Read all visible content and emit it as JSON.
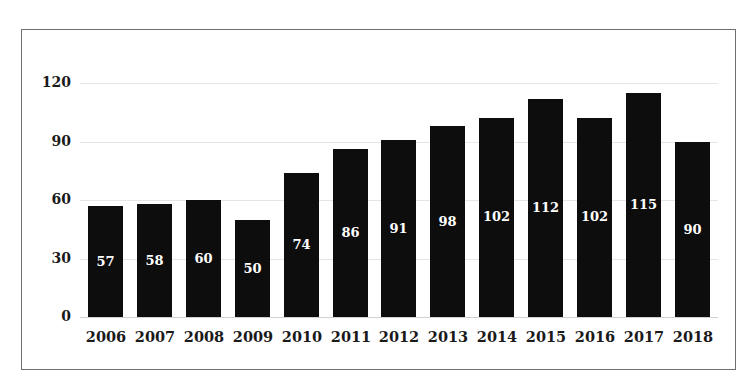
{
  "chart_data": {
    "type": "bar",
    "title": "",
    "xlabel": "",
    "ylabel": "",
    "categories": [
      "2006",
      "2007",
      "2008",
      "2009",
      "2010",
      "2011",
      "2012",
      "2013",
      "2014",
      "2015",
      "2016",
      "2017",
      "2018"
    ],
    "values": [
      57,
      58,
      60,
      50,
      74,
      86,
      91,
      98,
      102,
      112,
      102,
      115,
      90
    ],
    "ylim": [
      0,
      120
    ],
    "yticks": [
      0,
      30,
      60,
      90,
      120
    ],
    "grid": true,
    "legend": null,
    "bar_color": "#0d0d0d",
    "label_color": "#ffffff",
    "data_labels": true
  }
}
